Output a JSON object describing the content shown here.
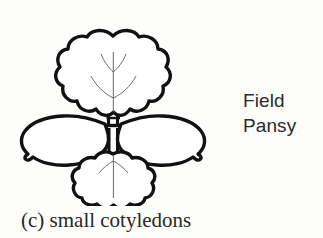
{
  "figure": {
    "name": "seedling-diagram",
    "species_label": {
      "line1": "Field",
      "line2": "Pansy"
    },
    "caption": "(c) small cotyledons",
    "caption_marker": "(c)",
    "caption_text": "small cotyledons",
    "colors": {
      "background": "#fdfdfb",
      "outline": "#111111",
      "vein": "#6a6a6a",
      "label_text": "#2b2b2b",
      "caption_text": "#2a2724"
    },
    "parts": [
      {
        "name": "true-leaf-upper",
        "description": "scalloped lobed true leaf at top",
        "veins": 5
      },
      {
        "name": "cotyledon-left",
        "description": "elongated oval cotyledon pointing left, notched tip"
      },
      {
        "name": "cotyledon-right",
        "description": "elongated oval cotyledon pointing right, notched tip"
      },
      {
        "name": "true-leaf-lower",
        "description": "smaller scalloped lobed leaf below center",
        "veins": 3
      },
      {
        "name": "stem",
        "description": "vertical hollow double-line stem with node crossbars",
        "nodes": 2
      }
    ]
  }
}
